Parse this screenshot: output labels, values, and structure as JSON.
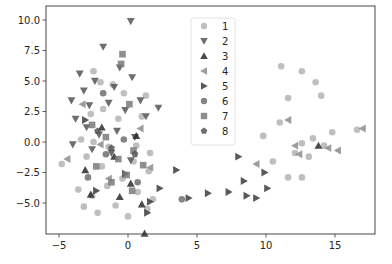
{
  "chart_data": {
    "type": "scatter",
    "title": "",
    "xlabel": "",
    "ylabel": "",
    "xlim": [
      -6.0,
      17.8
    ],
    "ylim": [
      -7.5,
      10.8
    ],
    "x_ticks": [
      -5,
      0,
      5,
      10,
      15
    ],
    "x_tick_labels": [
      "−5",
      "0",
      "5",
      "10",
      "15"
    ],
    "y_ticks": [
      10.0,
      7.5,
      5.0,
      2.5,
      0.0,
      -2.5,
      -5.0
    ],
    "y_tick_labels": [
      "10.0",
      "7.5",
      "5.0",
      "2.5",
      "0.0",
      "−2.5",
      "−5.0"
    ],
    "grid": false,
    "legend_position": "upper center",
    "series": [
      {
        "name": "1",
        "marker": "circle",
        "color": "#b4b4b4",
        "points": [
          [
            -2.5,
            5.8
          ],
          [
            -2.0,
            4.9
          ],
          [
            -1.1,
            4.7
          ],
          [
            -0.3,
            4.0
          ],
          [
            1.3,
            3.8
          ],
          [
            -2.7,
            2.3
          ],
          [
            -1.8,
            2.7
          ],
          [
            -0.7,
            1.9
          ],
          [
            1.0,
            2.1
          ],
          [
            -3.4,
            0.2
          ],
          [
            -2.5,
            0.0
          ],
          [
            -1.4,
            -0.4
          ],
          [
            0.6,
            -0.3
          ],
          [
            1.6,
            -0.9
          ],
          [
            -4.8,
            -1.8
          ],
          [
            -3.0,
            -1.2
          ],
          [
            -1.9,
            -2.0
          ],
          [
            0.4,
            -1.6
          ],
          [
            1.5,
            -2.4
          ],
          [
            -3.6,
            -3.9
          ],
          [
            -2.6,
            -4.4
          ],
          [
            -1.5,
            -3.6
          ],
          [
            0.7,
            -4.1
          ],
          [
            1.8,
            -4.7
          ],
          [
            -2.2,
            -5.8
          ],
          [
            -0.9,
            -5.2
          ],
          [
            0.0,
            -6.1
          ],
          [
            1.4,
            -5.5
          ],
          [
            -3.2,
            -5.3
          ],
          [
            -0.4,
            -3.0
          ],
          [
            11.1,
            6.2
          ],
          [
            12.6,
            5.8
          ],
          [
            13.6,
            4.9
          ],
          [
            11.6,
            3.6
          ],
          [
            14.0,
            3.8
          ],
          [
            11.0,
            1.6
          ],
          [
            9.8,
            0.5
          ],
          [
            13.4,
            0.3
          ],
          [
            14.8,
            0.8
          ],
          [
            14.2,
            -0.3
          ],
          [
            12.1,
            -0.9
          ],
          [
            12.6,
            -0.1
          ],
          [
            13.1,
            -1.2
          ],
          [
            11.6,
            -2.9
          ],
          [
            12.6,
            -2.9
          ],
          [
            16.6,
            1.0
          ],
          [
            10.5,
            -1.6
          ]
        ]
      },
      {
        "name": "2",
        "marker": "triangle_down",
        "color": "#555555",
        "points": [
          [
            0.2,
            9.9
          ],
          [
            -1.8,
            7.8
          ],
          [
            -3.5,
            5.6
          ],
          [
            -0.6,
            6.1
          ],
          [
            0.3,
            5.3
          ],
          [
            -4.1,
            3.4
          ],
          [
            -2.8,
            3.0
          ],
          [
            -1.4,
            3.2
          ],
          [
            -0.2,
            2.6
          ],
          [
            1.3,
            2.1
          ],
          [
            -3.0,
            1.2
          ],
          [
            -2.1,
            0.6
          ],
          [
            -0.8,
            0.9
          ],
          [
            0.5,
            0.4
          ],
          [
            -4.0,
            -0.2
          ],
          [
            -2.6,
            -0.6
          ],
          [
            -1.2,
            -0.9
          ],
          [
            0.2,
            -1.5
          ],
          [
            2.2,
            2.8
          ],
          [
            -3.2,
            4.2
          ],
          [
            -1.0,
            4.5
          ],
          [
            -2.4,
            5.0
          ],
          [
            -3.8,
            1.9
          ],
          [
            0.9,
            3.4
          ]
        ]
      },
      {
        "name": "3",
        "marker": "triangle_up",
        "color": "#2b2b2b",
        "points": [
          [
            -3.1,
            -2.3
          ],
          [
            -1.0,
            -1.2
          ],
          [
            0.6,
            0.5
          ],
          [
            -2.7,
            -4.3
          ],
          [
            0.2,
            -3.4
          ],
          [
            1.0,
            -5.1
          ],
          [
            -0.6,
            -4.5
          ],
          [
            1.2,
            -7.5
          ],
          [
            13.8,
            -0.3
          ],
          [
            -1.9,
            1.2
          ]
        ]
      },
      {
        "name": "4",
        "marker": "triangle_left",
        "color": "#8c8c8c",
        "points": [
          [
            11.6,
            1.8
          ],
          [
            12.4,
            -1.0
          ],
          [
            12.1,
            -0.3
          ],
          [
            14.5,
            -0.5
          ],
          [
            15.2,
            -0.7
          ],
          [
            17.0,
            1.1
          ],
          [
            9.3,
            -1.8
          ],
          [
            -4.4,
            -1.4
          ],
          [
            -2.0,
            -0.2
          ],
          [
            0.9,
            1.1
          ],
          [
            -1.4,
            -3.0
          ],
          [
            1.6,
            -2.1
          ],
          [
            -3.3,
            3.1
          ]
        ]
      },
      {
        "name": "5",
        "marker": "triangle_right",
        "color": "#3c3c3c",
        "points": [
          [
            3.5,
            -2.3
          ],
          [
            5.8,
            -4.2
          ],
          [
            8.4,
            -3.2
          ],
          [
            7.3,
            -4.1
          ],
          [
            9.3,
            -4.6
          ],
          [
            8.6,
            -4.4
          ],
          [
            8.0,
            -1.2
          ],
          [
            9.9,
            -2.5
          ],
          [
            10.1,
            -3.8
          ],
          [
            4.4,
            -4.6
          ],
          [
            2.3,
            -3.8
          ],
          [
            -2.3,
            -4.0
          ],
          [
            -0.2,
            -2.6
          ],
          [
            1.6,
            -4.9
          ],
          [
            -3.1,
            1.8
          ],
          [
            1.4,
            -5.8
          ]
        ]
      },
      {
        "name": "6",
        "marker": "circle",
        "color": "#6e6e6e",
        "points": [
          [
            3.9,
            -4.7
          ],
          [
            -1.6,
            -1.0
          ],
          [
            -0.3,
            0.2
          ],
          [
            -2.9,
            -2.9
          ],
          [
            0.7,
            -3.3
          ],
          [
            -1.8,
            4.0
          ]
        ]
      },
      {
        "name": "7",
        "marker": "square",
        "color": "#7a7a7a",
        "points": [
          [
            -0.4,
            7.2
          ],
          [
            -0.5,
            6.4
          ],
          [
            -2.3,
            -2.0
          ],
          [
            -0.7,
            -1.4
          ],
          [
            0.4,
            -0.7
          ],
          [
            -1.6,
            0.4
          ],
          [
            -0.1,
            -2.7
          ],
          [
            1.1,
            -1.9
          ],
          [
            -1.2,
            -3.3
          ],
          [
            0.3,
            -4.0
          ],
          [
            -2.6,
            1.4
          ],
          [
            0.1,
            3.1
          ]
        ]
      },
      {
        "name": "8",
        "marker": "pentagon",
        "color": "#555555",
        "points": [
          [
            -1.2,
            -0.5
          ],
          [
            0.5,
            -1.0
          ],
          [
            -2.2,
            0.9
          ]
        ]
      }
    ]
  },
  "legend": {
    "items": [
      {
        "label": "1",
        "marker": "circle",
        "color": "#b4b4b4"
      },
      {
        "label": "2",
        "marker": "triangle_down",
        "color": "#555555"
      },
      {
        "label": "3",
        "marker": "triangle_up",
        "color": "#2b2b2b"
      },
      {
        "label": "4",
        "marker": "triangle_left",
        "color": "#8c8c8c"
      },
      {
        "label": "5",
        "marker": "triangle_right",
        "color": "#3c3c3c"
      },
      {
        "label": "6",
        "marker": "circle",
        "color": "#6e6e6e"
      },
      {
        "label": "7",
        "marker": "square",
        "color": "#7a7a7a"
      },
      {
        "label": "8",
        "marker": "pentagon",
        "color": "#555555"
      }
    ]
  },
  "axes": {
    "frame_color": "#000000",
    "background": "#ffffff"
  }
}
